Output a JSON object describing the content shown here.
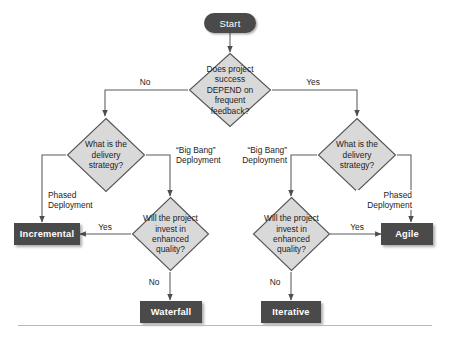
{
  "diagram": {
    "type": "flowchart",
    "start": {
      "label": "Start"
    },
    "decisions": [
      {
        "id": "depend",
        "text": "Does project success DEPEND on frequent feedback?"
      },
      {
        "id": "strategy_left",
        "text": "What is the delivery strategy?"
      },
      {
        "id": "strategy_right",
        "text": "What is the delivery strategy?"
      },
      {
        "id": "quality_left",
        "text": "Will the project invest in enhanced quality?"
      },
      {
        "id": "quality_right",
        "text": "Will the project invest in enhanced quality?"
      }
    ],
    "terminals": [
      {
        "id": "incremental",
        "label": "Incremental"
      },
      {
        "id": "waterfall",
        "label": "Waterfall"
      },
      {
        "id": "iterative",
        "label": "Iterative"
      },
      {
        "id": "agile",
        "label": "Agile"
      }
    ],
    "edge_labels": {
      "depend_no": "No",
      "depend_yes": "Yes",
      "left_phased": "Phased\nDeployment",
      "left_bigbang": "“Big Bang”\nDeployment",
      "right_bigbang": "“Big Bang”\nDeployment",
      "right_phased": "Phased\nDeployment",
      "quality_left_yes": "Yes",
      "quality_left_no": "No",
      "quality_right_yes": "Yes",
      "quality_right_no": "No"
    },
    "colors": {
      "decision_fill": "#d9d9d9",
      "decision_stroke": "#555555",
      "terminal_fill": "#4a4a4a",
      "terminal_text": "#ffffff",
      "connector": "#5a5a5a",
      "rule": "#b9b9b9",
      "background": "#ffffff"
    }
  }
}
